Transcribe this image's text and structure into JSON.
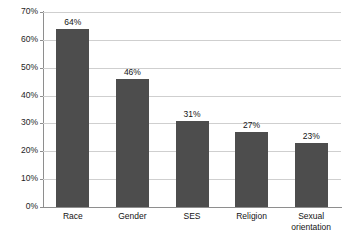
{
  "chart_data": {
    "type": "bar",
    "title": "",
    "subtitle": "",
    "xlabel": "",
    "ylabel": "",
    "categories": [
      "Race",
      "Gender",
      "SES",
      "Religion",
      "Sexual\norientation"
    ],
    "values": [
      64,
      46,
      31,
      27,
      23
    ],
    "value_labels": [
      "64%",
      "46%",
      "31%",
      "27%",
      "23%"
    ],
    "ylim": [
      0,
      70
    ],
    "ytick_labels": [
      "0%",
      "10%",
      "20%",
      "30%",
      "40%",
      "50%",
      "60%",
      "70%"
    ],
    "ytick_values": [
      0,
      10,
      20,
      30,
      40,
      50,
      60,
      70
    ],
    "grid": true,
    "legend": "none",
    "series": [
      {
        "name": "",
        "values": [
          64,
          46,
          31,
          27,
          23
        ]
      }
    ],
    "colors": {
      "bar": "#4d4d4d",
      "gridline": "#cfcfcf",
      "axis": "#8e8e8e",
      "text": "#141414",
      "background": "#ffffff"
    }
  },
  "cropped_header_text": ""
}
